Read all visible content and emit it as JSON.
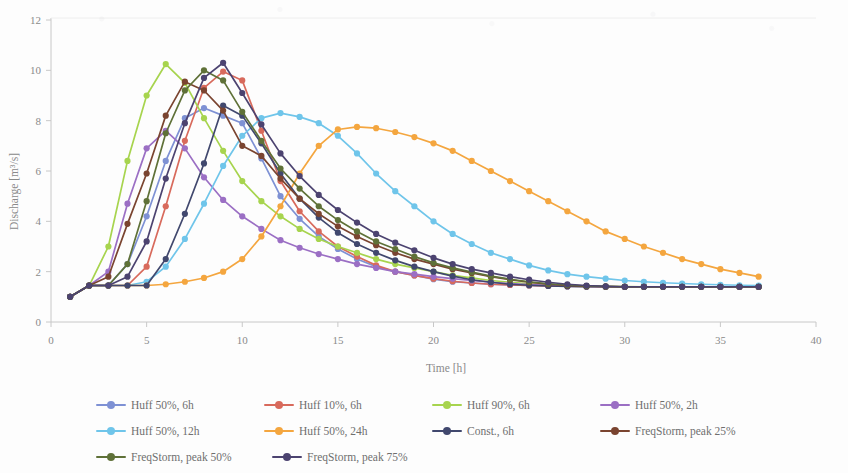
{
  "chart_data": {
    "type": "line",
    "title": "",
    "xlabel": "Time [h]",
    "ylabel": "Discharge [m³/s]",
    "xlim": [
      0,
      40
    ],
    "ylim": [
      0,
      12
    ],
    "xticks": [
      0,
      5,
      10,
      15,
      20,
      25,
      30,
      35,
      40
    ],
    "yticks": [
      0,
      2,
      4,
      6,
      8,
      10,
      12
    ],
    "grid": false,
    "legend_position": "bottom",
    "x": [
      1,
      2,
      3,
      4,
      5,
      6,
      7,
      8,
      9,
      10,
      11,
      12,
      13,
      14,
      15,
      16,
      17,
      18,
      19,
      20,
      21,
      22,
      23,
      24,
      25,
      26,
      27,
      28,
      29,
      30,
      31,
      32,
      33,
      34,
      35,
      36,
      37
    ],
    "series": [
      {
        "name": "Huff 50%, 6h",
        "color": "#7e91d4",
        "values": [
          1.0,
          1.45,
          1.45,
          2.3,
          4.2,
          6.4,
          8.1,
          8.5,
          8.2,
          7.9,
          6.5,
          5.0,
          4.1,
          3.4,
          2.9,
          2.5,
          2.2,
          2.0,
          1.85,
          1.7,
          1.6,
          1.55,
          1.5,
          1.47,
          1.45,
          1.43,
          1.42,
          1.41,
          1.4,
          1.4,
          1.4,
          1.4,
          1.4,
          1.4,
          1.4,
          1.4,
          1.4
        ]
      },
      {
        "name": "Huff 10%, 6h",
        "color": "#d86a5c",
        "values": [
          1.0,
          1.45,
          1.45,
          1.45,
          2.2,
          4.6,
          7.2,
          9.3,
          9.95,
          9.6,
          7.6,
          5.6,
          4.4,
          3.6,
          3.0,
          2.6,
          2.25,
          2.0,
          1.85,
          1.72,
          1.62,
          1.55,
          1.5,
          1.47,
          1.45,
          1.43,
          1.42,
          1.41,
          1.4,
          1.4,
          1.4,
          1.4,
          1.4,
          1.4,
          1.4,
          1.4,
          1.4
        ]
      },
      {
        "name": "Huff 90%, 6h",
        "color": "#a7d44e",
        "values": [
          1.0,
          1.45,
          3.0,
          6.4,
          9.0,
          10.25,
          9.5,
          8.1,
          6.8,
          5.6,
          4.8,
          4.2,
          3.7,
          3.3,
          3.0,
          2.75,
          2.5,
          2.3,
          2.15,
          2.0,
          1.85,
          1.75,
          1.65,
          1.58,
          1.52,
          1.48,
          1.45,
          1.43,
          1.42,
          1.41,
          1.4,
          1.4,
          1.4,
          1.4,
          1.4,
          1.4,
          1.4
        ]
      },
      {
        "name": "Huff 50%, 2h",
        "color": "#9b6fc4"
      },
      {
        "name": "Huff 50%, 12h",
        "color": "#6fc5ea"
      },
      {
        "name": "Huff 50%, 24h",
        "color": "#f4a63f"
      },
      {
        "name": "Const., 6h",
        "color": "#41486e"
      },
      {
        "name": "FreqStorm, peak 25%",
        "color": "#7a4430"
      },
      {
        "name": "FreqStorm, peak 50%",
        "color": "#5f7138"
      },
      {
        "name": "FreqStorm, peak 75%",
        "color": "#4c4370"
      }
    ],
    "all_series_values": {
      "Huff 50%, 6h": [
        1.0,
        1.45,
        1.45,
        2.3,
        4.2,
        6.4,
        8.1,
        8.5,
        8.2,
        7.9,
        6.5,
        5.0,
        4.1,
        3.4,
        2.9,
        2.5,
        2.2,
        2.0,
        1.85,
        1.7,
        1.6,
        1.55,
        1.5,
        1.47,
        1.45,
        1.43,
        1.42,
        1.41,
        1.4,
        1.4,
        1.4,
        1.4,
        1.4,
        1.4,
        1.4,
        1.4,
        1.4
      ],
      "Huff 10%, 6h": [
        1.0,
        1.45,
        1.45,
        1.45,
        2.2,
        4.6,
        7.2,
        9.3,
        9.95,
        9.6,
        7.6,
        5.6,
        4.4,
        3.6,
        3.0,
        2.6,
        2.25,
        2.0,
        1.85,
        1.72,
        1.62,
        1.55,
        1.5,
        1.47,
        1.45,
        1.43,
        1.42,
        1.41,
        1.4,
        1.4,
        1.4,
        1.4,
        1.4,
        1.4,
        1.4,
        1.4,
        1.4
      ],
      "Huff 90%, 6h": [
        1.0,
        1.45,
        3.0,
        6.4,
        9.0,
        10.25,
        9.5,
        8.1,
        6.8,
        5.6,
        4.8,
        4.2,
        3.7,
        3.3,
        3.0,
        2.75,
        2.5,
        2.3,
        2.15,
        2.0,
        1.85,
        1.75,
        1.65,
        1.58,
        1.52,
        1.48,
        1.45,
        1.43,
        1.42,
        1.41,
        1.4,
        1.4,
        1.4,
        1.4,
        1.4,
        1.4,
        1.4
      ],
      "Huff 50%, 2h": [
        1.0,
        1.45,
        2.0,
        4.7,
        6.9,
        7.6,
        6.9,
        5.75,
        4.85,
        4.2,
        3.7,
        3.25,
        2.95,
        2.7,
        2.5,
        2.3,
        2.15,
        2.0,
        1.9,
        1.8,
        1.72,
        1.65,
        1.58,
        1.53,
        1.49,
        1.46,
        1.44,
        1.42,
        1.41,
        1.4,
        1.4,
        1.4,
        1.4,
        1.4,
        1.4,
        1.4,
        1.4
      ],
      "Huff 50%, 12h": [
        1.0,
        1.45,
        1.45,
        1.45,
        1.6,
        2.2,
        3.3,
        4.7,
        6.2,
        7.4,
        8.1,
        8.3,
        8.15,
        7.9,
        7.4,
        6.7,
        5.9,
        5.2,
        4.6,
        4.0,
        3.5,
        3.1,
        2.75,
        2.5,
        2.25,
        2.05,
        1.9,
        1.8,
        1.72,
        1.65,
        1.6,
        1.56,
        1.53,
        1.5,
        1.48,
        1.46,
        1.45
      ],
      "Huff 50%, 24h": [
        1.0,
        1.45,
        1.45,
        1.45,
        1.45,
        1.5,
        1.6,
        1.75,
        2.0,
        2.5,
        3.4,
        4.6,
        5.9,
        7.0,
        7.65,
        7.75,
        7.7,
        7.55,
        7.35,
        7.1,
        6.8,
        6.4,
        6.0,
        5.6,
        5.2,
        4.8,
        4.4,
        4.0,
        3.6,
        3.3,
        3.0,
        2.75,
        2.5,
        2.3,
        2.1,
        1.95,
        1.8
      ]
    },
    "all_series_values_2": {
      "Const., 6h": [
        1.0,
        1.45,
        1.45,
        1.45,
        1.45,
        2.5,
        4.3,
        6.3,
        8.6,
        8.2,
        7.1,
        5.9,
        4.9,
        4.15,
        3.55,
        3.1,
        2.75,
        2.45,
        2.2,
        2.0,
        1.82,
        1.68,
        1.58,
        1.5,
        1.46,
        1.43,
        1.41,
        1.4,
        1.4,
        1.4,
        1.4,
        1.4,
        1.4,
        1.4,
        1.4,
        1.4,
        1.4
      ],
      "FreqStorm, peak 25%": [
        1.0,
        1.45,
        1.8,
        3.9,
        5.9,
        8.2,
        9.55,
        9.2,
        8.4,
        7.0,
        6.6,
        5.7,
        4.9,
        4.3,
        3.8,
        3.4,
        3.05,
        2.75,
        2.5,
        2.3,
        2.1,
        1.95,
        1.8,
        1.68,
        1.58,
        1.5,
        1.45,
        1.42,
        1.41,
        1.4,
        1.4,
        1.4,
        1.4,
        1.4,
        1.4,
        1.4,
        1.4
      ],
      "FreqStorm, peak 50%": [
        1.0,
        1.45,
        1.45,
        2.3,
        4.8,
        7.5,
        9.2,
        10.0,
        9.6,
        8.35,
        7.2,
        6.1,
        5.3,
        4.6,
        4.05,
        3.6,
        3.2,
        2.9,
        2.6,
        2.35,
        2.15,
        1.98,
        1.82,
        1.7,
        1.6,
        1.52,
        1.47,
        1.43,
        1.41,
        1.4,
        1.4,
        1.4,
        1.4,
        1.4,
        1.4,
        1.4,
        1.4
      ],
      "FreqStorm, peak 75%": [
        1.0,
        1.45,
        1.45,
        1.8,
        3.2,
        5.7,
        7.9,
        9.7,
        10.3,
        9.1,
        7.85,
        6.7,
        5.8,
        5.05,
        4.45,
        3.95,
        3.5,
        3.15,
        2.85,
        2.55,
        2.3,
        2.1,
        1.95,
        1.8,
        1.68,
        1.58,
        1.5,
        1.45,
        1.42,
        1.4,
        1.4,
        1.4,
        1.4,
        1.4,
        1.4,
        1.4,
        1.4
      ]
    }
  },
  "axes": {
    "y_title": "Discharge [m³/s]",
    "x_title": "Time [h]",
    "y_tick_0": "0",
    "y_tick_1": "2",
    "y_tick_2": "4",
    "y_tick_3": "6",
    "y_tick_4": "8",
    "y_tick_5": "10",
    "y_tick_6": "12",
    "x_tick_0": "0",
    "x_tick_1": "5",
    "x_tick_2": "10",
    "x_tick_3": "15",
    "x_tick_4": "20",
    "x_tick_5": "25",
    "x_tick_6": "30",
    "x_tick_7": "35",
    "x_tick_8": "40"
  },
  "legend": {
    "items": [
      {
        "label": "Huff 50%, 6h",
        "color": "#7e91d4"
      },
      {
        "label": "Huff 10%, 6h",
        "color": "#d86a5c"
      },
      {
        "label": "Huff 90%, 6h",
        "color": "#a7d44e"
      },
      {
        "label": "Huff 50%, 2h",
        "color": "#9b6fc4"
      },
      {
        "label": "Huff 50%, 12h",
        "color": "#6fc5ea"
      },
      {
        "label": "Huff 50%, 24h",
        "color": "#f4a63f"
      },
      {
        "label": "Const., 6h",
        "color": "#41486e"
      },
      {
        "label": "FreqStorm, peak 25%",
        "color": "#7a4430"
      },
      {
        "label": "FreqStorm, peak 50%",
        "color": "#5f7138"
      },
      {
        "label": "FreqStorm, peak 75%",
        "color": "#4c4370"
      }
    ]
  }
}
